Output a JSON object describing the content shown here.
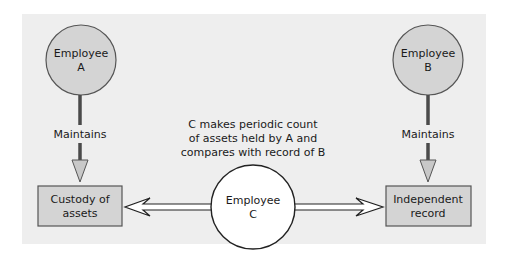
{
  "diagram": {
    "background": "#eeeeee",
    "colors": {
      "node_fill": "#d4d4d4",
      "node_stroke": "#555555",
      "stem": "#4a4a4a",
      "arrow_head_fill": "#c8c8c8",
      "center_fill": "#ffffff",
      "text": "#1a1a1a"
    },
    "employee_a": {
      "line1": "Employee",
      "line2": "A"
    },
    "employee_b": {
      "line1": "Employee",
      "line2": "B"
    },
    "employee_c": {
      "line1": "Employee",
      "line2": "C"
    },
    "maintains_a": "Maintains",
    "maintains_b": "Maintains",
    "custody_box": {
      "line1": "Custody of",
      "line2": "assets"
    },
    "record_box": {
      "line1": "Independent",
      "line2": "record"
    },
    "caption": {
      "line1": "C makes periodic count",
      "line2": "of assets held by A and",
      "line3": "compares with record of B"
    }
  }
}
